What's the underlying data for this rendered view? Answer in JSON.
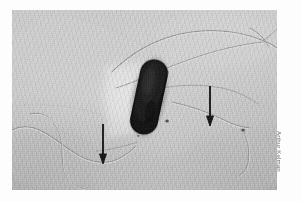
{
  "figure": {
    "kind": "electron-micrograph",
    "credit": "Arthur Kelman",
    "colors": {
      "page_background": "#fdfdfd",
      "emulsion_background": "#c6c6c6",
      "cell_body": "#151515",
      "halo": "#e6e6e6",
      "flagella_dark": "#8d8d8d",
      "flagella_light": "#e3e3e3",
      "arrow": "#101010",
      "credit_text": "#6a6a6a"
    },
    "plate": {
      "left": 12,
      "top": 10,
      "width": 265,
      "height": 180
    },
    "cell": {
      "label": "bacterial-cell-body",
      "center_x": 149,
      "center_y": 97,
      "width_px": 27,
      "height_px": 76,
      "rotation_deg": 12
    },
    "halo": {
      "label": "light-halo",
      "center_x": 124,
      "center_y": 94
    },
    "annotations": [
      {
        "name": "arrow-lower-left",
        "x": 103,
        "y": 126,
        "length": 34,
        "points": "down",
        "indicates": "flagellum"
      },
      {
        "name": "arrow-right",
        "x": 210,
        "y": 87,
        "length": 36,
        "points": "down",
        "indicates": "flagellum"
      }
    ],
    "features": [
      {
        "name": "flagellum-upper-right-long"
      },
      {
        "name": "flagellum-upper-right-second"
      },
      {
        "name": "flagellum-mid-right"
      },
      {
        "name": "flagellum-lower-left-wavy"
      },
      {
        "name": "flagellum-lower-left-second"
      },
      {
        "name": "flagellum-detached-right"
      },
      {
        "name": "debris-particle-right"
      },
      {
        "name": "debris-particle-cell-edge"
      }
    ]
  }
}
